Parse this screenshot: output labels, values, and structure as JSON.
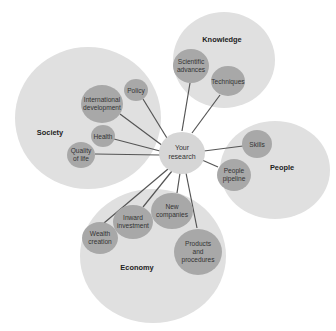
{
  "diagram": {
    "center": {
      "label_line1": "Your",
      "label_line2": "research"
    },
    "groups": {
      "society": {
        "label": "Society",
        "nodes": [
          {
            "id": "policy",
            "lines": [
              "Policy"
            ]
          },
          {
            "id": "international-development",
            "lines": [
              "International",
              "development"
            ]
          },
          {
            "id": "health",
            "lines": [
              "Health"
            ]
          },
          {
            "id": "quality-of-life",
            "lines": [
              "Quality",
              "of life"
            ]
          }
        ]
      },
      "knowledge": {
        "label": "Knowledge",
        "nodes": [
          {
            "id": "scientific-advances",
            "lines": [
              "Scientific",
              "advances"
            ]
          },
          {
            "id": "techniques",
            "lines": [
              "Techniques"
            ]
          }
        ]
      },
      "people": {
        "label": "People",
        "nodes": [
          {
            "id": "skills",
            "lines": [
              "Skills"
            ]
          },
          {
            "id": "people-pipeline",
            "lines": [
              "People",
              "pipeline"
            ]
          }
        ]
      },
      "economy": {
        "label": "Economy",
        "nodes": [
          {
            "id": "wealth-creation",
            "lines": [
              "Wealth",
              "creation"
            ]
          },
          {
            "id": "inward-investment",
            "lines": [
              "Inward",
              "investment"
            ]
          },
          {
            "id": "new-companies",
            "lines": [
              "New",
              "companies"
            ]
          },
          {
            "id": "products-and-procedures",
            "lines": [
              "Products",
              "and",
              "procedures"
            ]
          }
        ]
      }
    },
    "colors": {
      "group_fill": "#e0e0e0",
      "node_fill": "#a8a8a8",
      "center_fill": "#d6d6d6",
      "connector": "#555555"
    }
  }
}
